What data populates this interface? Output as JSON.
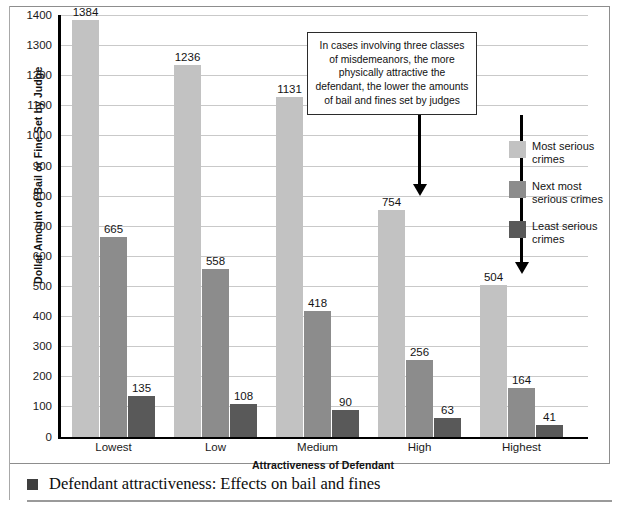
{
  "chart_data": {
    "type": "bar",
    "title": "",
    "xlabel": "Attractiveness of Defendant",
    "ylabel": "Dollar Amount of Bail or Fine Set by Judge",
    "categories": [
      "Lowest",
      "Low",
      "Medium",
      "High",
      "Highest"
    ],
    "ylim": [
      0,
      1400
    ],
    "ytick_step": 100,
    "yticks": [
      "1400",
      "1300",
      "1200",
      "1100",
      "1000",
      "900",
      "800",
      "700",
      "600",
      "500",
      "400",
      "300",
      "200",
      "100",
      "0"
    ],
    "grid": true,
    "legend_position": "right",
    "series": [
      {
        "name": "Most serious crimes",
        "color": "#c2c2c2",
        "values": [
          1384,
          1236,
          1131,
          754,
          504
        ]
      },
      {
        "name": "Next most serious crimes",
        "color": "#8c8c8c",
        "values": [
          665,
          558,
          418,
          256,
          164
        ]
      },
      {
        "name": "Least serious crimes",
        "color": "#595959",
        "values": [
          135,
          108,
          90,
          63,
          41
        ]
      }
    ],
    "annotations": [
      {
        "text": "In cases involving three classes of misdemeanors, the more physically attractive the defendant, the lower the amounts of bail and fines set by judges",
        "arrows": [
          "High",
          "Highest"
        ]
      }
    ]
  },
  "legend": {
    "items": [
      {
        "label": "Most serious crimes",
        "color": "#c2c2c2"
      },
      {
        "label": "Next most serious crimes",
        "color": "#8c8c8c"
      },
      {
        "label": "Least serious crimes",
        "color": "#595959"
      }
    ]
  },
  "caption": {
    "text": "Defendant attractiveness: Effects on bail and fines"
  }
}
